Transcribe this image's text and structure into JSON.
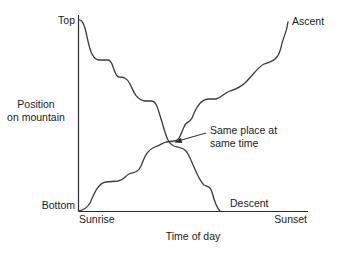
{
  "diagram": {
    "type": "line-plot-conceptual",
    "y_axis": {
      "label_line1": "Position",
      "label_line2": "on mountain",
      "top_label": "Top",
      "bottom_label": "Bottom"
    },
    "x_axis": {
      "label": "Time of day",
      "start_label": "Sunrise",
      "end_label": "Sunset"
    },
    "curves": [
      {
        "name": "Ascent",
        "label": "Ascent",
        "direction": "bottom-to-top"
      },
      {
        "name": "Descent",
        "label": "Descent",
        "direction": "top-to-bottom"
      }
    ],
    "annotation": {
      "line1": "Same place at",
      "line2": "same time"
    },
    "colors": {
      "line": "#3a3a3a",
      "axis": "#2a2a2a",
      "text": "#1a1a1a",
      "background": "#ffffff"
    }
  }
}
